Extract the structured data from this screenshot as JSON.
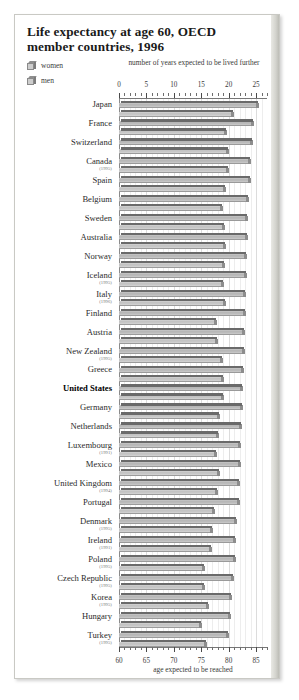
{
  "title": "Life expectancy at age 60, OECD member countries, 1996",
  "legend": {
    "items": [
      {
        "label": "women",
        "icon": "cube-swatch-icon"
      },
      {
        "label": "men",
        "icon": "cube-swatch-icon"
      }
    ]
  },
  "axes": {
    "top_title": "number of years expected to be lived further",
    "bottom_title": "age expected to be reached",
    "top_ticks": [
      "0",
      "5",
      "10",
      "15",
      "20",
      "25"
    ],
    "bottom_ticks": [
      "60",
      "65",
      "70",
      "75",
      "80",
      "85"
    ]
  },
  "chart_data": {
    "type": "bar",
    "orientation": "horizontal",
    "title": "Life expectancy at age 60, OECD member countries, 1996",
    "xlabel": "number of years expected to be lived further",
    "xlabel_secondary": "age expected to be reached",
    "ylabel": "",
    "xlim": [
      0,
      27
    ],
    "xlim_secondary": [
      60,
      87
    ],
    "xticks": [
      0,
      5,
      10,
      15,
      20,
      25
    ],
    "xticks_secondary": [
      60,
      65,
      70,
      75,
      80,
      85
    ],
    "grid": true,
    "legend_position": "top-left",
    "categories": [
      "Japan",
      "France",
      "Switzerland",
      "Canada",
      "Spain",
      "Belgium",
      "Sweden",
      "Australia",
      "Norway",
      "Iceland",
      "Italy",
      "Finland",
      "Austria",
      "New Zealand",
      "Greece",
      "United States",
      "Germany",
      "Netherlands",
      "Luxembourg",
      "Mexico",
      "United Kingdom",
      "Portugal",
      "Denmark",
      "Ireland",
      "Poland",
      "Czech Republic",
      "Korea",
      "Hungary",
      "Turkey"
    ],
    "category_years": [
      "",
      "",
      "",
      "1995",
      "",
      "",
      "",
      "",
      "",
      "1995",
      "1996",
      "",
      "",
      "1995",
      "",
      "",
      "",
      "",
      "1991",
      "",
      "1994",
      "",
      "1995",
      "1991",
      "1995",
      "1995",
      "1995",
      "",
      "1995"
    ],
    "highlighted_category": "United States",
    "series": [
      {
        "name": "women",
        "values": [
          25.5,
          24.6,
          24.4,
          24.1,
          24.0,
          23.7,
          23.6,
          23.5,
          23.4,
          23.3,
          23.2,
          23.1,
          23.0,
          22.9,
          22.8,
          22.7,
          22.6,
          22.5,
          22.3,
          22.2,
          22.1,
          22.0,
          21.6,
          21.4,
          21.3,
          21.0,
          20.7,
          20.4,
          20.0
        ]
      },
      {
        "name": "men",
        "values": [
          20.9,
          19.7,
          20.1,
          20.0,
          19.5,
          18.9,
          19.4,
          19.6,
          19.3,
          19.1,
          19.6,
          17.9,
          18.0,
          19.0,
          19.2,
          19.1,
          18.4,
          18.2,
          17.9,
          18.5,
          18.0,
          17.5,
          17.1,
          17.0,
          15.7,
          15.6,
          16.4,
          15.2,
          16.0
        ]
      }
    ]
  }
}
